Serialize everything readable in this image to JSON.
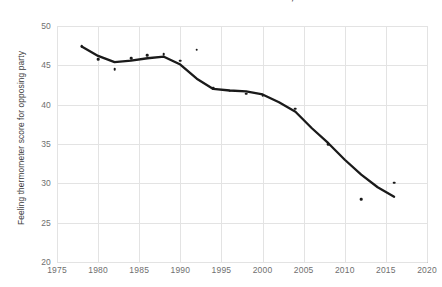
{
  "title": "FIGURE 3A: AMERICANS' FEELINGS TOWARD THE OPPOSING PARTY, 1978–2016",
  "axes": {
    "ylabel": "Feeling thermometer score for opposing party",
    "xlabel": "",
    "yticks": [
      20,
      25,
      30,
      35,
      40,
      45,
      50
    ],
    "xticks": [
      1975,
      1980,
      1985,
      1990,
      1995,
      2000,
      2005,
      2010,
      2015,
      2020
    ],
    "ylim": [
      20,
      50
    ],
    "xlim": [
      1975,
      2020
    ],
    "grid": true
  },
  "colors": {
    "line": "#1a1a1a",
    "point": "#1a1a1a",
    "grid": "#e3e3e3",
    "axis": "#c9c9c9",
    "tick_text": "#6f6f6f",
    "title_text": "#222222",
    "background": "#ffffff"
  },
  "chart_data": {
    "type": "scatter",
    "title": "FIGURE 3A: AMERICANS' FEELINGS TOWARD THE OPPOSING PARTY, 1978–2016",
    "xlabel": "",
    "ylabel": "Feeling thermometer score for opposing party",
    "xlim": [
      1975,
      2020
    ],
    "ylim": [
      20,
      50
    ],
    "grid": true,
    "legend": "none",
    "series": [
      {
        "name": "Feeling thermometer score",
        "type": "scatter",
        "points": [
          {
            "x": 1978,
            "y": 47.4
          },
          {
            "x": 1980,
            "y": 45.8
          },
          {
            "x": 1982,
            "y": 44.5
          },
          {
            "x": 1984,
            "y": 45.9
          },
          {
            "x": 1986,
            "y": 46.3
          },
          {
            "x": 1988,
            "y": 46.4
          },
          {
            "x": 1990,
            "y": 45.6
          },
          {
            "x": 1992,
            "y": 47.0
          },
          {
            "x": 1994,
            "y": 42.1
          },
          {
            "x": 1996,
            "y": 41.8
          },
          {
            "x": 1998,
            "y": 41.4
          },
          {
            "x": 2000,
            "y": 41.2
          },
          {
            "x": 2004,
            "y": 39.5
          },
          {
            "x": 2008,
            "y": 35.0
          },
          {
            "x": 2012,
            "y": 28.0
          },
          {
            "x": 2016,
            "y": 30.1
          }
        ]
      },
      {
        "name": "Smoothed trend",
        "type": "line",
        "points": [
          {
            "x": 1978,
            "y": 47.4
          },
          {
            "x": 1980,
            "y": 46.2
          },
          {
            "x": 1982,
            "y": 45.4
          },
          {
            "x": 1984,
            "y": 45.6
          },
          {
            "x": 1986,
            "y": 45.9
          },
          {
            "x": 1988,
            "y": 46.1
          },
          {
            "x": 1990,
            "y": 45.1
          },
          {
            "x": 1992,
            "y": 43.3
          },
          {
            "x": 1994,
            "y": 42.0
          },
          {
            "x": 1996,
            "y": 41.8
          },
          {
            "x": 1998,
            "y": 41.7
          },
          {
            "x": 2000,
            "y": 41.3
          },
          {
            "x": 2002,
            "y": 40.3
          },
          {
            "x": 2004,
            "y": 39.1
          },
          {
            "x": 2006,
            "y": 37.0
          },
          {
            "x": 2008,
            "y": 35.1
          },
          {
            "x": 2010,
            "y": 33.0
          },
          {
            "x": 2012,
            "y": 31.1
          },
          {
            "x": 2014,
            "y": 29.5
          },
          {
            "x": 2016,
            "y": 28.3
          }
        ]
      }
    ]
  }
}
